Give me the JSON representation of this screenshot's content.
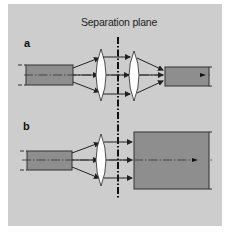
{
  "figure": {
    "title": "Separation plane",
    "panels": [
      {
        "id": "a",
        "label": "a",
        "description": "Beam expanded by lens, collimated across separation plane, refocused by second lens into output fiber"
      },
      {
        "id": "b",
        "label": "b",
        "description": "Beam expanded by single lens, collimated across separation plane onto large receiving area"
      }
    ]
  },
  "colors": {
    "background": "#cdcdcd",
    "fiber_fill": "#8e8e8e",
    "line": "#222222",
    "lens": "#ffffff",
    "border": "#ffffff"
  }
}
